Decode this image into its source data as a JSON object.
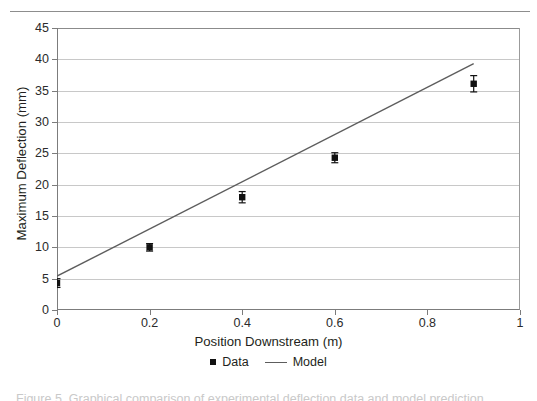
{
  "figure": {
    "top_rule": true,
    "caption_partial": "Figure 5. Graphical comparison of experimental deflection data and model prediction"
  },
  "legend": {
    "position": "bottom-center",
    "entries": [
      {
        "label": "Data",
        "marker": "square",
        "color": "#111111"
      },
      {
        "label": "Model",
        "marker": "line",
        "color": "#5d5d5d"
      }
    ]
  },
  "colors": {
    "marker": "#111111",
    "model_line": "#5d5d5d",
    "gridline": "#c8c8c8",
    "axis": "#7c7c7c",
    "text": "#231f20"
  },
  "chart_data": {
    "type": "scatter",
    "title": "",
    "xlabel": "Position Downstream (m)",
    "ylabel": "Maximum Deflection (mm)",
    "xlim": [
      0,
      1
    ],
    "ylim": [
      0,
      45
    ],
    "xticks": [
      0,
      0.2,
      0.4,
      0.6,
      0.8,
      1
    ],
    "xtick_labels": [
      "0",
      "0.2",
      "0.4",
      "0.6",
      "0.8",
      "1"
    ],
    "yticks": [
      0,
      5,
      10,
      15,
      20,
      25,
      30,
      35,
      40,
      45
    ],
    "ytick_labels": [
      "0",
      "5",
      "10",
      "15",
      "20",
      "25",
      "30",
      "35",
      "40",
      "45"
    ],
    "grid": "horizontal",
    "legend_position": "bottom",
    "series": [
      {
        "name": "Data",
        "type": "scatter",
        "marker": "square",
        "x": [
          0.0,
          0.2,
          0.4,
          0.6,
          0.9
        ],
        "y": [
          4.3,
          10.0,
          18.0,
          24.3,
          36.1
        ],
        "yerr": [
          0.7,
          0.6,
          0.9,
          0.8,
          1.3
        ]
      },
      {
        "name": "Model",
        "type": "line",
        "x": [
          0.0,
          0.9
        ],
        "y": [
          5.4,
          39.3
        ]
      }
    ]
  }
}
